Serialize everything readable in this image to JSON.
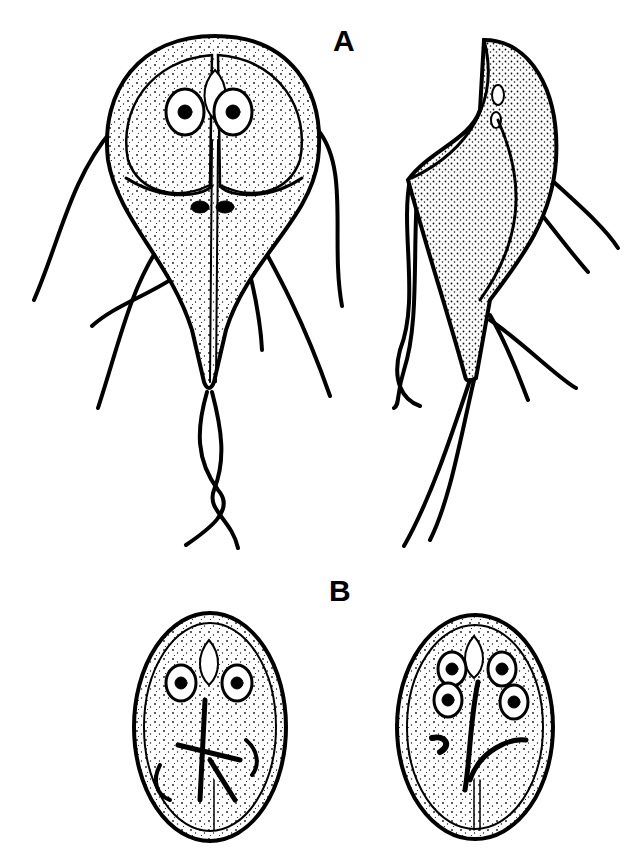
{
  "figure": {
    "panels": [
      {
        "label": "A",
        "content": "trophozoite-front-view, trophozoite-side-view"
      },
      {
        "label": "B",
        "content": "cyst-two-nuclei, cyst-four-nuclei"
      }
    ]
  },
  "colors": {
    "ink": "#000000",
    "background": "#ffffff",
    "stipple": "#1a1a1a"
  }
}
